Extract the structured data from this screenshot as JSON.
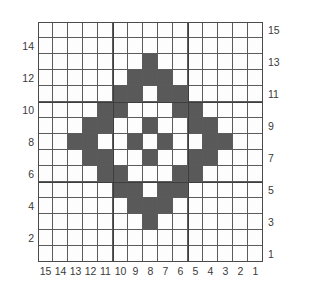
{
  "figure": {
    "kind": "pixel-grid-pattern",
    "title": "",
    "grid": {
      "columns": 15,
      "rows": 15,
      "cell_width": 15,
      "cell_height": 16,
      "fill_color": "#595959",
      "empty_color": "#fdfdfd",
      "line_color": "#5b5b5b",
      "major_line_color": "#3d3d3d",
      "major_every": 5
    },
    "axes": {
      "bottom_labels": [
        "15",
        "14",
        "13",
        "12",
        "11",
        "10",
        "9",
        "8",
        "7",
        "6",
        "5",
        "4",
        "3",
        "2",
        "1"
      ],
      "left_labels": [
        {
          "row": 1,
          "text": "14"
        },
        {
          "row": 3,
          "text": "12"
        },
        {
          "row": 5,
          "text": "10"
        },
        {
          "row": 7,
          "text": "8"
        },
        {
          "row": 9,
          "text": "6"
        },
        {
          "row": 11,
          "text": "4"
        },
        {
          "row": 13,
          "text": "2"
        }
      ],
      "right_labels": [
        {
          "row": 0,
          "text": "15"
        },
        {
          "row": 2,
          "text": "13"
        },
        {
          "row": 4,
          "text": "11"
        },
        {
          "row": 6,
          "text": "9"
        },
        {
          "row": 8,
          "text": "7"
        },
        {
          "row": 10,
          "text": "5"
        },
        {
          "row": 12,
          "text": "3"
        },
        {
          "row": 14,
          "text": "1"
        }
      ]
    },
    "pattern": [
      [
        0,
        0,
        0,
        0,
        0,
        0,
        0,
        0,
        0,
        0,
        0,
        0,
        0,
        0,
        0
      ],
      [
        0,
        0,
        0,
        0,
        0,
        0,
        0,
        0,
        0,
        0,
        0,
        0,
        0,
        0,
        0
      ],
      [
        0,
        0,
        0,
        0,
        0,
        0,
        0,
        1,
        0,
        0,
        0,
        0,
        0,
        0,
        0
      ],
      [
        0,
        0,
        0,
        0,
        0,
        0,
        1,
        1,
        1,
        0,
        0,
        0,
        0,
        0,
        0
      ],
      [
        0,
        0,
        0,
        0,
        0,
        1,
        1,
        0,
        1,
        1,
        0,
        0,
        0,
        0,
        0
      ],
      [
        0,
        0,
        0,
        0,
        1,
        1,
        0,
        0,
        0,
        1,
        1,
        0,
        0,
        0,
        0
      ],
      [
        0,
        0,
        0,
        1,
        1,
        0,
        0,
        1,
        0,
        0,
        1,
        1,
        0,
        0,
        0
      ],
      [
        0,
        0,
        1,
        1,
        0,
        0,
        1,
        0,
        1,
        0,
        0,
        1,
        1,
        0,
        0
      ],
      [
        0,
        0,
        0,
        1,
        1,
        0,
        0,
        1,
        0,
        0,
        1,
        1,
        0,
        0,
        0
      ],
      [
        0,
        0,
        0,
        0,
        1,
        1,
        0,
        0,
        0,
        1,
        1,
        0,
        0,
        0,
        0
      ],
      [
        0,
        0,
        0,
        0,
        0,
        1,
        1,
        0,
        1,
        1,
        0,
        0,
        0,
        0,
        0
      ],
      [
        0,
        0,
        0,
        0,
        0,
        0,
        1,
        1,
        1,
        0,
        0,
        0,
        0,
        0,
        0
      ],
      [
        0,
        0,
        0,
        0,
        0,
        0,
        0,
        1,
        0,
        0,
        0,
        0,
        0,
        0,
        0
      ],
      [
        0,
        0,
        0,
        0,
        0,
        0,
        0,
        0,
        0,
        0,
        0,
        0,
        0,
        0,
        0
      ],
      [
        0,
        0,
        0,
        0,
        0,
        0,
        0,
        0,
        0,
        0,
        0,
        0,
        0,
        0,
        0
      ]
    ]
  }
}
